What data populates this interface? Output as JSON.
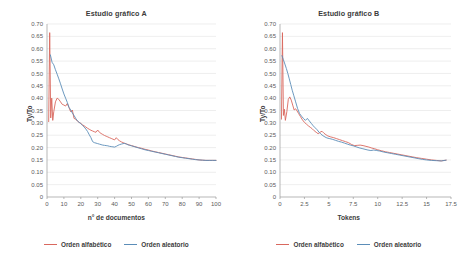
{
  "legend": {
    "series": [
      {
        "label": "Orden alfabético",
        "color": "#D9685E"
      },
      {
        "label": "Orden aleatorio",
        "color": "#5B8DB8"
      }
    ]
  },
  "axis_style": {
    "grid_color": "#E2E2E2",
    "axis_color": "#9A9A9A",
    "tick_color": "#5A5A5A",
    "background": "#FFFFFF"
  },
  "chart_data": [
    {
      "type": "line",
      "title": "Estudio gráfico A",
      "xlabel": "n° de documentos",
      "ylabel": "Ty/To",
      "xlim": [
        0,
        100
      ],
      "ylim": [
        0,
        0.7
      ],
      "grid": true,
      "legend_position": "bottom",
      "xticks": [
        0,
        10,
        20,
        30,
        40,
        50,
        60,
        70,
        80,
        90,
        100
      ],
      "yticks": [
        0,
        0.05,
        0.1,
        0.15,
        0.2,
        0.25,
        0.3,
        0.35,
        0.4,
        0.45,
        0.5,
        0.55,
        0.6,
        0.65,
        0.7
      ],
      "ytick_labels": [
        "0",
        "0.05",
        "0.10",
        "0.15",
        "0.20",
        "0.25",
        "0.30",
        "0.35",
        "0.40",
        "0.45",
        "0.50",
        "0.55",
        "0.60",
        "0.65",
        "0.70"
      ],
      "series": [
        {
          "name": "Orden alfabético",
          "color": "#D9685E",
          "x": [
            1,
            1.6,
            2.2,
            2.8,
            3.4,
            4,
            5,
            6,
            7,
            8,
            9,
            10,
            11,
            12,
            13,
            14,
            15,
            16,
            17,
            18,
            19,
            20,
            21,
            22,
            23,
            24,
            25,
            26,
            27,
            28,
            29,
            30,
            31,
            32,
            33,
            34,
            35,
            36,
            37,
            38,
            39,
            40,
            41,
            42,
            43,
            44,
            45,
            46,
            47,
            48,
            49,
            50,
            52,
            54,
            56,
            58,
            60,
            62,
            64,
            66,
            68,
            70,
            72,
            74,
            76,
            78,
            80,
            82,
            84,
            86,
            88,
            90,
            92,
            94,
            96,
            98,
            100
          ],
          "values": [
            0.305,
            0.665,
            0.32,
            0.4,
            0.31,
            0.345,
            0.385,
            0.4,
            0.395,
            0.385,
            0.375,
            0.372,
            0.368,
            0.378,
            0.362,
            0.345,
            0.352,
            0.318,
            0.315,
            0.307,
            0.302,
            0.298,
            0.292,
            0.288,
            0.283,
            0.278,
            0.274,
            0.27,
            0.267,
            0.264,
            0.262,
            0.271,
            0.262,
            0.257,
            0.253,
            0.249,
            0.246,
            0.243,
            0.24,
            0.237,
            0.234,
            0.231,
            0.24,
            0.232,
            0.227,
            0.223,
            0.22,
            0.217,
            0.215,
            0.212,
            0.21,
            0.208,
            0.204,
            0.2,
            0.197,
            0.193,
            0.19,
            0.186,
            0.183,
            0.18,
            0.177,
            0.174,
            0.171,
            0.168,
            0.165,
            0.162,
            0.16,
            0.158,
            0.156,
            0.154,
            0.152,
            0.15,
            0.149,
            0.148,
            0.148,
            0.148,
            0.148
          ]
        },
        {
          "name": "Orden aleatorio",
          "color": "#5B8DB8",
          "x": [
            2,
            3,
            4,
            5,
            6,
            7,
            8,
            9,
            10,
            11,
            12,
            13,
            14,
            15,
            16,
            17,
            18,
            19,
            20,
            21,
            22,
            23,
            24,
            25,
            26,
            27,
            28,
            29,
            30,
            31,
            32,
            33,
            34,
            35,
            36,
            37,
            38,
            39,
            40,
            41,
            42,
            43,
            44,
            45,
            46,
            47,
            48,
            49,
            50,
            52,
            54,
            56,
            58,
            60,
            62,
            64,
            66,
            68,
            70,
            72,
            74,
            76,
            78,
            80,
            82,
            84,
            86,
            88,
            90,
            92,
            94,
            96,
            98,
            100
          ],
          "values": [
            0.575,
            0.545,
            0.535,
            0.515,
            0.497,
            0.478,
            0.458,
            0.437,
            0.417,
            0.4,
            0.383,
            0.363,
            0.352,
            0.34,
            0.33,
            0.318,
            0.308,
            0.302,
            0.297,
            0.29,
            0.283,
            0.275,
            0.265,
            0.252,
            0.24,
            0.224,
            0.22,
            0.218,
            0.216,
            0.214,
            0.212,
            0.21,
            0.209,
            0.208,
            0.207,
            0.205,
            0.204,
            0.203,
            0.202,
            0.205,
            0.209,
            0.212,
            0.214,
            0.216,
            0.217,
            0.214,
            0.211,
            0.209,
            0.207,
            0.203,
            0.199,
            0.195,
            0.191,
            0.188,
            0.185,
            0.182,
            0.179,
            0.176,
            0.173,
            0.17,
            0.167,
            0.164,
            0.161,
            0.159,
            0.157,
            0.155,
            0.153,
            0.151,
            0.15,
            0.149,
            0.148,
            0.148,
            0.148,
            0.148
          ]
        }
      ]
    },
    {
      "type": "line",
      "title": "Estudio gráfico B",
      "xlabel": "Tokens",
      "ylabel": "Ty/To",
      "xlim": [
        0,
        17.5
      ],
      "ylim": [
        0,
        0.7
      ],
      "grid": true,
      "legend_position": "bottom",
      "xticks": [
        0,
        2.5,
        5,
        7.5,
        10,
        12.5,
        15,
        17.5
      ],
      "xtick_labels": [
        "0",
        "2.5",
        "5",
        "7.5",
        "10",
        "12.5",
        "15",
        "17.5"
      ],
      "yticks": [
        0,
        0.05,
        0.1,
        0.15,
        0.2,
        0.25,
        0.3,
        0.35,
        0.4,
        0.45,
        0.5,
        0.55,
        0.6,
        0.65,
        0.7
      ],
      "ytick_labels": [
        "0",
        "0.05",
        "0.10",
        "0.15",
        "0.20",
        "0.25",
        "0.30",
        "0.35",
        "0.40",
        "0.45",
        "0.50",
        "0.55",
        "0.60",
        "0.65",
        "0.70"
      ],
      "series": [
        {
          "name": "Orden alfabético",
          "color": "#D9685E",
          "x": [
            0.15,
            0.25,
            0.35,
            0.45,
            0.55,
            0.7,
            0.85,
            1.0,
            1.15,
            1.3,
            1.45,
            1.6,
            1.75,
            1.9,
            2.1,
            2.3,
            2.5,
            2.7,
            2.9,
            3.1,
            3.3,
            3.5,
            3.7,
            3.9,
            4.1,
            4.3,
            4.5,
            4.7,
            4.9,
            5.2,
            5.5,
            5.8,
            6.1,
            6.4,
            6.7,
            7.0,
            7.3,
            7.6,
            7.9,
            8.2,
            8.5,
            8.8,
            9.1,
            9.4,
            9.7,
            10.0,
            10.4,
            10.8,
            11.2,
            11.6,
            12.0,
            12.4,
            12.8,
            13.2,
            13.6,
            14.0,
            14.5,
            15.0,
            15.5,
            16.0,
            16.5,
            17.0
          ],
          "values": [
            0.315,
            0.665,
            0.33,
            0.355,
            0.31,
            0.345,
            0.395,
            0.405,
            0.392,
            0.372,
            0.352,
            0.357,
            0.348,
            0.338,
            0.325,
            0.312,
            0.302,
            0.295,
            0.288,
            0.282,
            0.276,
            0.268,
            0.262,
            0.256,
            0.262,
            0.266,
            0.258,
            0.252,
            0.247,
            0.243,
            0.24,
            0.236,
            0.232,
            0.228,
            0.224,
            0.22,
            0.213,
            0.208,
            0.209,
            0.21,
            0.208,
            0.205,
            0.202,
            0.198,
            0.195,
            0.191,
            0.187,
            0.183,
            0.18,
            0.177,
            0.174,
            0.171,
            0.168,
            0.165,
            0.162,
            0.159,
            0.156,
            0.153,
            0.15,
            0.148,
            0.146,
            0.149
          ]
        },
        {
          "name": "Orden aleatorio",
          "color": "#5B8DB8",
          "x": [
            0.2,
            0.35,
            0.5,
            0.65,
            0.8,
            0.95,
            1.1,
            1.25,
            1.4,
            1.6,
            1.8,
            2.0,
            2.2,
            2.4,
            2.6,
            2.8,
            3.0,
            3.2,
            3.4,
            3.6,
            3.8,
            4.0,
            4.2,
            4.4,
            4.6,
            4.8,
            5.1,
            5.4,
            5.7,
            6.0,
            6.3,
            6.6,
            6.9,
            7.2,
            7.5,
            7.8,
            8.1,
            8.4,
            8.7,
            9.0,
            9.3,
            9.6,
            9.9,
            10.2,
            10.6,
            11.0,
            11.4,
            11.8,
            12.2,
            12.6,
            13.0,
            13.4,
            13.8,
            14.2,
            14.6,
            15.0,
            15.5,
            16.0,
            16.5,
            17.0
          ],
          "values": [
            0.572,
            0.555,
            0.538,
            0.52,
            0.5,
            0.478,
            0.455,
            0.432,
            0.412,
            0.385,
            0.358,
            0.338,
            0.327,
            0.318,
            0.31,
            0.318,
            0.308,
            0.298,
            0.288,
            0.28,
            0.272,
            0.262,
            0.254,
            0.248,
            0.243,
            0.239,
            0.236,
            0.233,
            0.229,
            0.225,
            0.222,
            0.218,
            0.214,
            0.21,
            0.207,
            0.203,
            0.199,
            0.196,
            0.193,
            0.19,
            0.188,
            0.19,
            0.188,
            0.186,
            0.182,
            0.179,
            0.176,
            0.173,
            0.17,
            0.167,
            0.164,
            0.161,
            0.158,
            0.155,
            0.152,
            0.15,
            0.148,
            0.147,
            0.146,
            0.149
          ]
        }
      ]
    }
  ]
}
